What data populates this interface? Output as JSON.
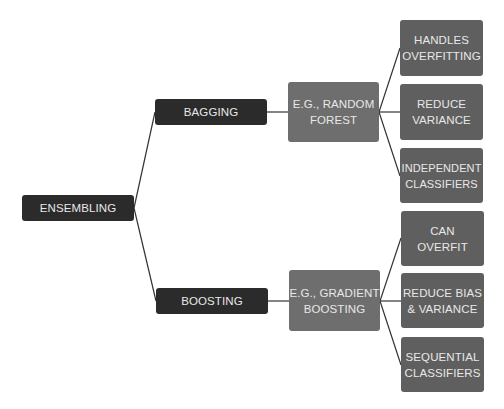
{
  "diagram": {
    "type": "mind-map",
    "root": {
      "label": "ENSEMBLING",
      "children": [
        {
          "label": "BAGGING",
          "example": "E.G., RANDOM\nFOREST",
          "properties": [
            "HANDLES\nOVERFITTING",
            "REDUCE\nVARIANCE",
            "INDEPENDENT\nCLASSIFIERS"
          ]
        },
        {
          "label": "BOOSTING",
          "example": "E.G., GRADIENT\nBOOSTING",
          "properties": [
            "CAN\nOVERFIT",
            "REDUCE BIAS\n& VARIANCE",
            "SEQUENTIAL\nCLASSIFIERS"
          ]
        }
      ]
    },
    "colors": {
      "background": "#ffffff",
      "dark_node": "#2b2b2b",
      "example_node": "#6e6e6e",
      "leaf_node": "#5f5f5f",
      "text": "#e8e8e8",
      "connector": "#333333"
    }
  }
}
